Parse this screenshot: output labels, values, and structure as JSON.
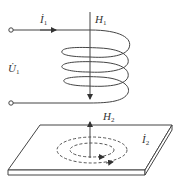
{
  "diagram": {
    "type": "electromagnetic-induction",
    "labels": {
      "current_1": "İ",
      "current_1_sub": "1",
      "voltage_1": "U̇",
      "voltage_1_sub": "1",
      "field_1": "H",
      "field_1_sub": "1",
      "field_2": "H",
      "field_2_sub": "2",
      "current_2": "İ",
      "current_2_sub": "2"
    },
    "colors": {
      "line": "#444444",
      "text": "#333333",
      "plate_fill": "#ffffff"
    }
  }
}
